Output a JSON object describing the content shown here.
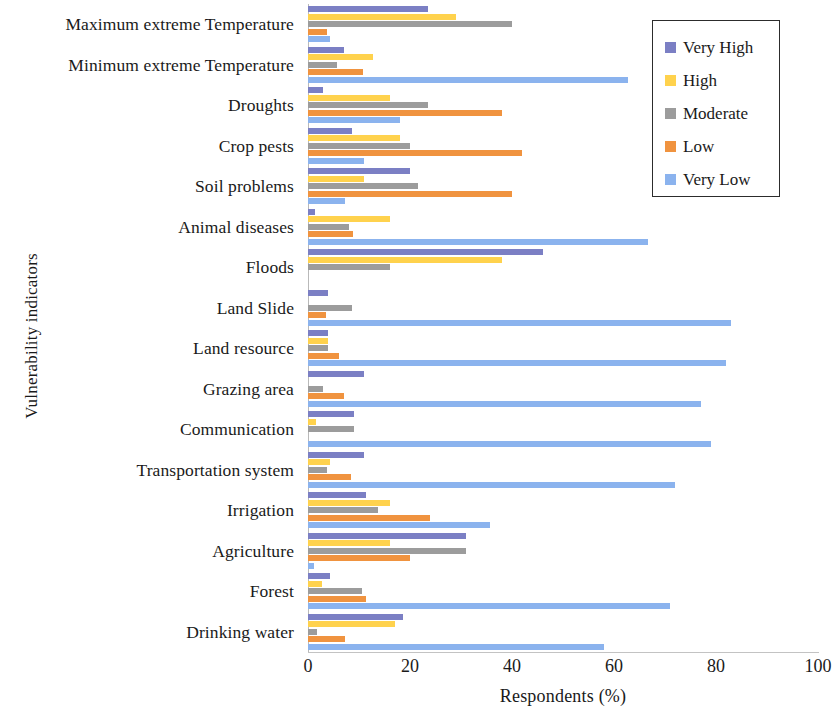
{
  "chart_data": {
    "type": "bar",
    "orientation": "horizontal",
    "title": "",
    "xlabel": "Respondents (%)",
    "ylabel": "Vulnerability indicators",
    "xlim": [
      0,
      100
    ],
    "xticks": [
      0,
      20,
      40,
      60,
      80,
      100
    ],
    "grid": false,
    "legend_position": "top-right",
    "categories": [
      "Maximum extreme Temperature",
      "Minimum extreme Temperature",
      "Droughts",
      "Crop pests",
      "Soil problems",
      "Animal diseases",
      "Floods",
      "Land Slide",
      "Land resource",
      "Grazing area",
      "Communication",
      "Transportation system",
      "Irrigation",
      "Agriculture",
      "Forest",
      "Drinking water"
    ],
    "series": [
      {
        "name": "Very High",
        "color": "#7b7fc4",
        "values": [
          23.5,
          7.0,
          3.0,
          8.6,
          20.0,
          1.4,
          46.0,
          4.0,
          4.0,
          11.0,
          9.0,
          11.0,
          11.4,
          31.0,
          4.3,
          18.6
        ]
      },
      {
        "name": "High",
        "color": "#ffd24d",
        "values": [
          29.0,
          12.7,
          16.0,
          18.0,
          11.0,
          16.0,
          38.0,
          0.0,
          4.0,
          0.0,
          1.5,
          4.3,
          16.0,
          16.0,
          2.7,
          17.0
        ]
      },
      {
        "name": "Moderate",
        "color": "#9c9c9c",
        "values": [
          40.0,
          5.7,
          23.5,
          20.0,
          21.5,
          8.0,
          16.0,
          8.6,
          4.0,
          3.0,
          9.0,
          3.7,
          13.7,
          31.0,
          10.6,
          1.8
        ]
      },
      {
        "name": "Low",
        "color": "#f0933f",
        "values": [
          3.7,
          10.8,
          38.0,
          42.0,
          40.0,
          8.8,
          0.0,
          3.5,
          6.0,
          7.0,
          0.0,
          8.4,
          24.0,
          20.0,
          11.4,
          7.3
        ]
      },
      {
        "name": "Very Low",
        "color": "#8bb3ee",
        "values": [
          4.3,
          62.7,
          18.0,
          11.0,
          7.3,
          66.7,
          0.0,
          83.0,
          82.0,
          77.0,
          79.0,
          72.0,
          35.7,
          1.2,
          71.0,
          58.0
        ]
      }
    ]
  },
  "axes": {
    "x_title": "Respondents (%)",
    "y_title": "Vulnerability indicators",
    "x_tick_labels": [
      "0",
      "20",
      "40",
      "60",
      "80",
      "100"
    ]
  },
  "legend": {
    "items": [
      {
        "label": "Very High",
        "color": "#7b7fc4"
      },
      {
        "label": "High",
        "color": "#ffd24d"
      },
      {
        "label": "Moderate",
        "color": "#9c9c9c"
      },
      {
        "label": "Low",
        "color": "#f0933f"
      },
      {
        "label": "Very Low",
        "color": "#8bb3ee"
      }
    ]
  }
}
